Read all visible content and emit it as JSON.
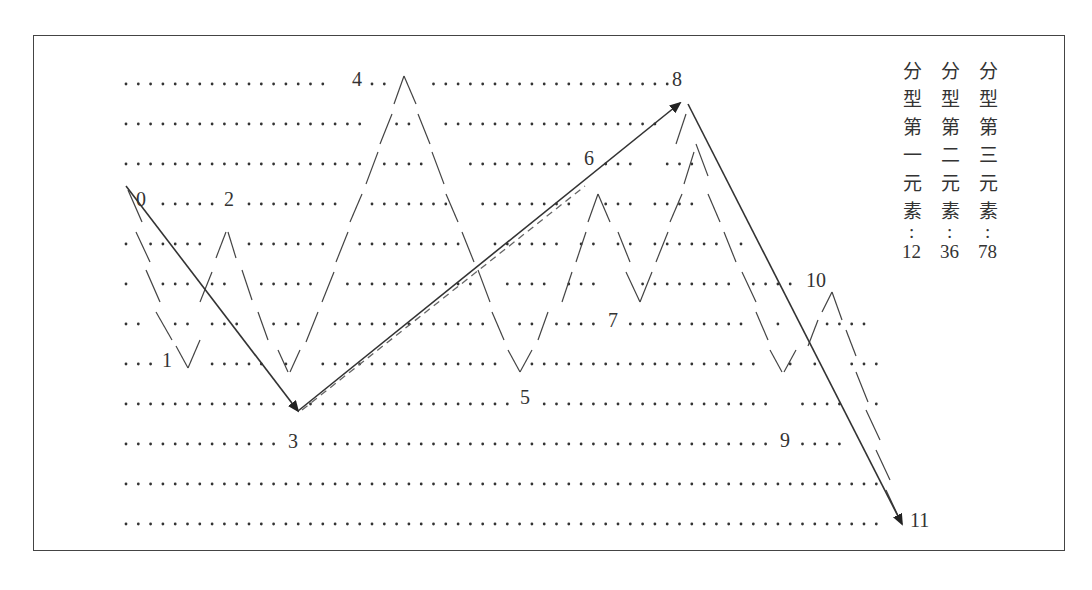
{
  "diagram": {
    "point_labels": [
      "0",
      "1",
      "2",
      "3",
      "4",
      "5",
      "6",
      "7",
      "8",
      "9",
      "10",
      "11"
    ],
    "legend": [
      {
        "heading": "分型第一元素",
        "colon": ":",
        "value": "12"
      },
      {
        "heading": "分型第二元素",
        "colon": ":",
        "value": "36"
      },
      {
        "heading": "分型第三元素",
        "colon": ":",
        "value": "78"
      }
    ],
    "arrows": [
      {
        "from": "0",
        "to": "3",
        "style": "solid"
      },
      {
        "from": "3",
        "to": "8",
        "style": "solid"
      },
      {
        "from": "3",
        "to": "6",
        "style": "dashed"
      },
      {
        "from": "8",
        "to": "11",
        "style": "solid"
      }
    ],
    "colors": {
      "line": "#333333",
      "dots": "#333333",
      "dash": "#666666",
      "border": "#444444"
    }
  }
}
